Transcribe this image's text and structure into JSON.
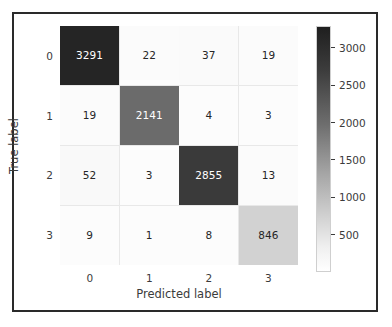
{
  "chart_data": {
    "type": "heatmap",
    "title": "",
    "xlabel": "Predicted label",
    "ylabel": "True label",
    "x_tick_labels": [
      "0",
      "1",
      "2",
      "3"
    ],
    "y_tick_labels": [
      "0",
      "1",
      "2",
      "3"
    ],
    "categories": [
      "0",
      "1",
      "2",
      "3"
    ],
    "matrix": [
      [
        3291,
        22,
        37,
        19
      ],
      [
        19,
        2141,
        4,
        3
      ],
      [
        52,
        3,
        2855,
        13
      ],
      [
        9,
        1,
        8,
        846
      ]
    ],
    "cell_text": [
      [
        "3291",
        "22",
        "37",
        "19"
      ],
      [
        "19",
        "2141",
        "4",
        "3"
      ],
      [
        "52",
        "3",
        "2855",
        "13"
      ],
      [
        "9",
        "1",
        "8",
        "846"
      ]
    ],
    "cell_colors": [
      [
        "#252525",
        "#fbfbfb",
        "#fafafa",
        "#fbfbfb"
      ],
      [
        "#fbfbfb",
        "#6b6b6b",
        "#fcfcfc",
        "#fcfcfc"
      ],
      [
        "#f9f9f9",
        "#fcfcfc",
        "#3a3a3a",
        "#fbfbfb"
      ],
      [
        "#fcfcfc",
        "#fcfcfc",
        "#fcfcfc",
        "#d2d2d2"
      ]
    ],
    "cell_text_colors": [
      [
        "#ffffff",
        "#262626",
        "#262626",
        "#262626"
      ],
      [
        "#262626",
        "#ffffff",
        "#262626",
        "#262626"
      ],
      [
        "#262626",
        "#262626",
        "#ffffff",
        "#262626"
      ],
      [
        "#262626",
        "#262626",
        "#262626",
        "#262626"
      ]
    ],
    "colorbar": {
      "tick_labels": [
        "3000",
        "2500",
        "2000",
        "1500",
        "1000",
        "500"
      ],
      "tick_values": [
        3000,
        2500,
        2000,
        1500,
        1000,
        500
      ],
      "vmin": 1,
      "vmax": 3291,
      "colormap": "Greys",
      "orientation": "vertical",
      "top_color": "#1f1f1f",
      "bottom_color": "#ffffff"
    },
    "grid": false,
    "legend_position": "right-colorbar"
  }
}
